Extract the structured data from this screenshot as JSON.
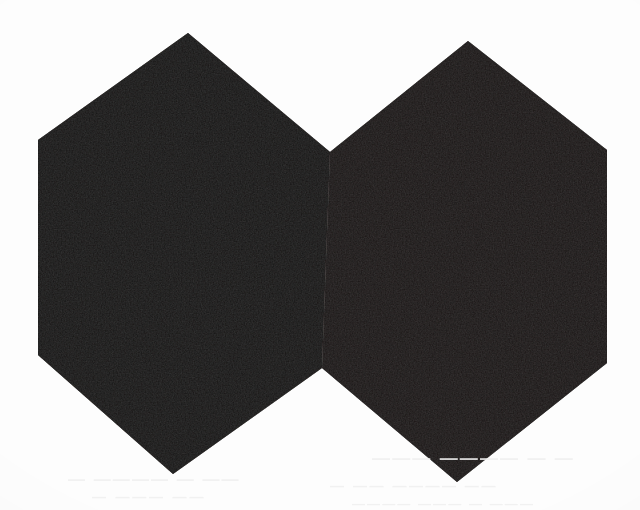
{
  "artwork": {
    "title": "Double Hexagon Silhouette",
    "medium": "scanned print",
    "canvas": {
      "width": 640,
      "height": 510
    },
    "colors": {
      "background": "#fdfdfd",
      "figure_fill": "#161312",
      "figure_fill_secondary": "#1b1716",
      "ghost_text": "#efefef"
    },
    "shapes": [
      {
        "name": "left-hexagon",
        "sides": 6,
        "points": "188,33 330,152 322,368 173,474 38,355 38,140"
      },
      {
        "name": "right-hexagon",
        "sides": 6,
        "points": "468,41 607,150 607,363 457,482 322,368 330,152"
      }
    ],
    "vertices": {
      "left_top_apex": "188,33",
      "left_upper_left": "38,140",
      "left_lower_left": "38,355",
      "left_bottom_apex": "173,474",
      "center_upper_notch": "330,152",
      "center_lower_notch": "322,368",
      "right_top_apex": "468,41",
      "right_upper_right": "607,150",
      "right_lower_right": "607,363",
      "right_bottom_apex": "457,482"
    }
  },
  "ghost_text": {
    "left_upper": "— ———— — ——",
    "left_lower": "— ——— ——",
    "right_upper": "——— ———— — —",
    "right_lower": "—  ——  ————  ——",
    "right_tail": "———— ——— — ———"
  }
}
